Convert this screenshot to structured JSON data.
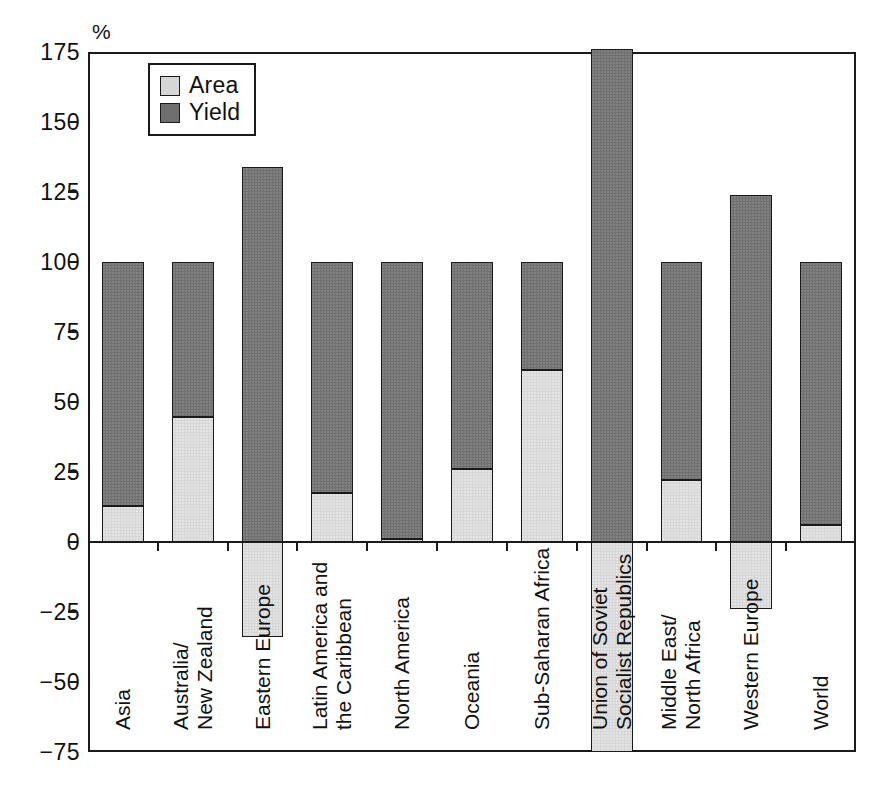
{
  "chart_data": {
    "type": "bar",
    "title": "",
    "subtitle": "",
    "xlabel": "",
    "ylabel": "",
    "unit_label": "%",
    "ylim": [
      -75,
      175
    ],
    "yticks": [
      175,
      150,
      125,
      100,
      75,
      50,
      25,
      0,
      -25,
      -50,
      -75
    ],
    "ytick_labels": [
      "175",
      "150",
      "125",
      "100",
      "75",
      "50",
      "25",
      "0",
      "−25",
      "−50",
      "−75"
    ],
    "grid": false,
    "stacked": true,
    "legend_position": "top-left-inside",
    "legend": [
      "Area",
      "Yield"
    ],
    "categories": [
      "Asia",
      "Australia/\nNew Zealand",
      "Eastern Europe",
      "Latin America and\nthe Caribbean",
      "North America",
      "Oceania",
      "Sub-Saharan Africa",
      "Union of Soviet\nSocialist Republics",
      "Middle East/\nNorth Africa",
      "Western Europe",
      "World"
    ],
    "series": [
      {
        "name": "Area",
        "color": "#d6d6d6",
        "values": [
          13,
          44.5,
          -34,
          17.5,
          1,
          26,
          61.5,
          -76,
          22,
          -24,
          6
        ]
      },
      {
        "name": "Yield",
        "color": "#6f6f6f",
        "values": [
          87,
          55.5,
          134,
          82.5,
          99,
          74,
          38.5,
          176,
          78,
          124,
          94
        ]
      }
    ],
    "totals": [
      100,
      100,
      100,
      100,
      100,
      100,
      100,
      100,
      100,
      100,
      100
    ]
  },
  "colors": {
    "area": "#d6d6d6",
    "yield": "#6f6f6f",
    "axis": "#1a1a1a",
    "background": "#ffffff"
  },
  "legend": {
    "items": [
      {
        "label": "Area",
        "color": "#d6d6d6"
      },
      {
        "label": "Yield",
        "color": "#6f6f6f"
      }
    ]
  }
}
